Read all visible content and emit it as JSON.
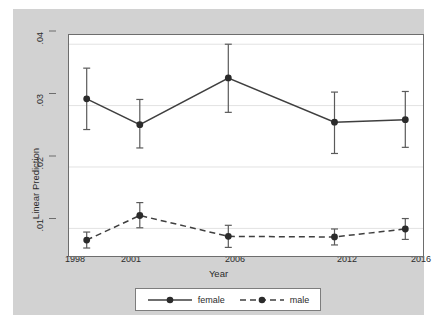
{
  "chart_data": {
    "type": "line",
    "title": "",
    "subtitle": "",
    "xlabel": "Year",
    "ylabel": "Linear Prediction",
    "x": [
      1998,
      2001,
      2006,
      2012,
      2016
    ],
    "xtick_labels": [
      "1998",
      "2001",
      "2006",
      "2012",
      "2016"
    ],
    "ytick_labels": [
      ".04",
      ".03",
      ".02",
      ".01"
    ],
    "ytick_values": [
      0.04,
      0.03,
      0.02,
      0.01
    ],
    "xlim": [
      1997.0,
      2017.0
    ],
    "ylim": [
      0.0055,
      0.0415
    ],
    "grid": "horizontal",
    "legend_position": "bottom-center",
    "series": [
      {
        "name": "female",
        "style": "solid",
        "marker": "circle",
        "color": "#3f3f3f",
        "values": [
          0.0311,
          0.0269,
          0.0345,
          0.0273,
          0.0277
        ],
        "ci_low": [
          0.0261,
          0.0231,
          0.0289,
          0.0222,
          0.0232
        ],
        "ci_high": [
          0.0361,
          0.031,
          0.04,
          0.0322,
          0.0323
        ]
      },
      {
        "name": "male",
        "style": "dashed",
        "marker": "circle",
        "color": "#3f3f3f",
        "values": [
          0.0081,
          0.0121,
          0.0087,
          0.0086,
          0.0099
        ],
        "ci_low": [
          0.0068,
          0.0101,
          0.0069,
          0.0073,
          0.0082
        ],
        "ci_high": [
          0.0094,
          0.0142,
          0.0105,
          0.0099,
          0.0116
        ]
      }
    ]
  },
  "legend": {
    "entries": [
      {
        "label": "female"
      },
      {
        "label": "male"
      }
    ]
  },
  "axes": {
    "y_title": "Linear Prediction",
    "x_title": "Year",
    "y_ticks": [
      ".04",
      ".03",
      ".02",
      ".01"
    ],
    "x_ticks": [
      "1998",
      "2001",
      "2006",
      "2012",
      "2016"
    ]
  },
  "colors": {
    "plot_background": "#ffffff",
    "graph_background": "#d2d2d2",
    "page_background": "#ffffff",
    "line": "#3f3f3f",
    "marker": "#2b2b2b",
    "gridline": "#e2e2e2",
    "axis_text": "#2b2b2b",
    "frame": "#6d6d6d"
  }
}
